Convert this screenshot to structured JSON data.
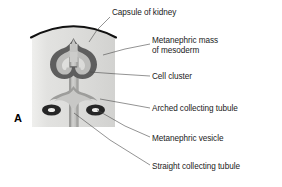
{
  "figure": {
    "panel_letter": "A"
  },
  "labels": [
    {
      "id": "capsule-of-kidney",
      "text": "Capsule of kidney",
      "x": 112,
      "y": 8,
      "leader": [
        [
          110,
          17
        ],
        [
          97,
          30
        ],
        [
          89,
          42
        ]
      ]
    },
    {
      "id": "metanephric-mass-of-mesoderm",
      "text": "Metanephric mass",
      "text2": "of mesoderm",
      "x": 152,
      "y": 36,
      "leader": [
        [
          150,
          44
        ],
        [
          125,
          49
        ],
        [
          103,
          55
        ]
      ]
    },
    {
      "id": "cell-cluster",
      "text": "Cell cluster",
      "x": 152,
      "y": 72,
      "leader": [
        [
          150,
          76
        ],
        [
          118,
          74
        ],
        [
          90,
          72
        ]
      ]
    },
    {
      "id": "arched-collecting-tubule",
      "text": "Arched collecting tubule",
      "x": 152,
      "y": 104,
      "leader": [
        [
          150,
          108
        ],
        [
          128,
          104
        ],
        [
          100,
          99
        ]
      ]
    },
    {
      "id": "metanephric-vesicle",
      "text": "Metanephric vesicle",
      "x": 152,
      "y": 134,
      "leader": [
        [
          150,
          137
        ],
        [
          125,
          126
        ],
        [
          97,
          110
        ]
      ]
    },
    {
      "id": "straight-collecting-tubule",
      "text": "Straight collecting tubule",
      "x": 152,
      "y": 162,
      "leader": [
        [
          150,
          165
        ],
        [
          110,
          140
        ],
        [
          74,
          113
        ]
      ]
    }
  ],
  "colors": {
    "capsule_line": "#111111",
    "block_fill": "#d8d8d6",
    "block_fill_light": "#e8e8e6",
    "tubule_dark": "#565656",
    "tubule_mid": "#9a9a9a",
    "tubule_light": "#c9c9c7",
    "vesicle_ring": "#2b2b2b",
    "vesicle_core": "#e9e9e7",
    "leader_line": "#4a4a4a",
    "text": "#1a1a1a"
  },
  "structures": [
    {
      "id": "kidney-capsule",
      "name": "Capsule of kidney"
    },
    {
      "id": "metanephric-mass",
      "name": "Metanephric mass of mesoderm"
    },
    {
      "id": "cell-cluster",
      "name": "Cell cluster"
    },
    {
      "id": "arched-collecting-tubule",
      "name": "Arched collecting tubule"
    },
    {
      "id": "metanephric-vesicle",
      "name": "Metanephric vesicle"
    },
    {
      "id": "straight-collecting-tubule",
      "name": "Straight collecting tubule"
    }
  ]
}
